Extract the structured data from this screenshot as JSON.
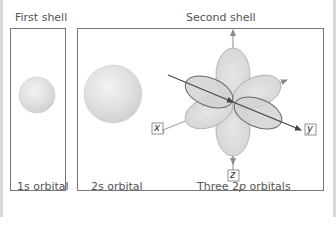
{
  "headings": {
    "first_shell": "First shell",
    "second_shell": "Second shell"
  },
  "labels": {
    "s1": "1s orbital",
    "s2": "2s orbital",
    "p2_prefix": "Three 2",
    "p2_italic": "p",
    "p2_suffix": " orbitals"
  },
  "axes": {
    "x": "x",
    "y": "y",
    "z": "z"
  },
  "colors": {
    "border": "#777777",
    "orbital_fill": "#d9d9d9",
    "orbital_stroke": "#8a8a8a",
    "axis": "#8a8a8a",
    "dark_axis": "#444444",
    "text": "#555555"
  }
}
